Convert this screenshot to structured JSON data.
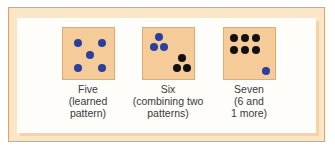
{
  "colors": {
    "frame_border": "#e9a063",
    "frame_fill": "#fbe6c8",
    "panel_fill": "#fffdf9",
    "tile_fill": "#f6cb9a",
    "tile_border": "#e6a96d",
    "blue_dot": "#2b3f9f",
    "black_dot": "#111111"
  },
  "figures": [
    {
      "number": 5,
      "caption_lines": [
        "Five",
        "(learned",
        "pattern)"
      ],
      "dots": [
        {
          "x": 15,
          "y": 15,
          "color": "blue"
        },
        {
          "x": 39,
          "y": 15,
          "color": "blue"
        },
        {
          "x": 27,
          "y": 27,
          "color": "blue"
        },
        {
          "x": 15,
          "y": 40,
          "color": "blue"
        },
        {
          "x": 39,
          "y": 40,
          "color": "blue"
        }
      ]
    },
    {
      "number": 6,
      "caption_lines": [
        "Six",
        "(combining two",
        "patterns)"
      ],
      "dots": [
        {
          "x": 16,
          "y": 9,
          "color": "blue"
        },
        {
          "x": 11,
          "y": 19,
          "color": "blue"
        },
        {
          "x": 21,
          "y": 19,
          "color": "blue"
        },
        {
          "x": 39,
          "y": 30,
          "color": "black"
        },
        {
          "x": 34,
          "y": 40,
          "color": "black"
        },
        {
          "x": 44,
          "y": 40,
          "color": "black"
        }
      ]
    },
    {
      "number": 7,
      "caption_lines": [
        "Seven",
        "(6 and",
        "1 more)"
      ],
      "dots": [
        {
          "x": 10,
          "y": 10,
          "color": "black"
        },
        {
          "x": 21,
          "y": 10,
          "color": "black"
        },
        {
          "x": 32,
          "y": 10,
          "color": "black"
        },
        {
          "x": 10,
          "y": 22,
          "color": "black"
        },
        {
          "x": 21,
          "y": 22,
          "color": "black"
        },
        {
          "x": 32,
          "y": 22,
          "color": "black"
        },
        {
          "x": 42,
          "y": 43,
          "color": "blue"
        }
      ]
    }
  ]
}
